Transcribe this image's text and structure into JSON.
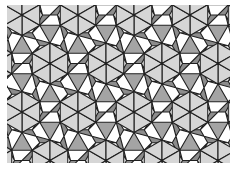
{
  "image": {
    "width": 233,
    "height": 170,
    "description": "Rhombitrihexagonal (3.4.6.4) tiling pattern in grayscale"
  },
  "tiling": {
    "type": "3.4.6.4",
    "clip": {
      "x": 7,
      "y": 5,
      "width": 223,
      "height": 158
    },
    "origin": {
      "x": 22,
      "y": 15
    },
    "lattice_spacing": 56,
    "edge": 20.5,
    "hexagon_split": true
  },
  "colors": {
    "background": "#ffffff",
    "hexagon_triangle": "#d6d6d6",
    "square": "#8c8c8c",
    "triangle": "#a4a4a4",
    "stroke": "#202020"
  },
  "stroke_width": 1.1
}
